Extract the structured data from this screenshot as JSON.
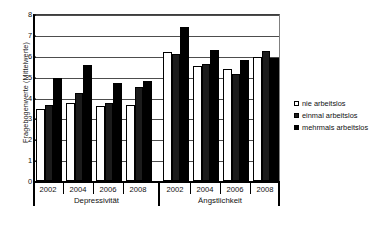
{
  "chart_data": {
    "type": "bar",
    "title": "",
    "xlabel": "",
    "ylabel": "Fragebogenwerte (Mittelwerte)",
    "ylim": [
      0,
      8
    ],
    "ytick_labels": [
      "0",
      "1",
      "2",
      "3",
      "4",
      "5",
      "6",
      "7",
      "8"
    ],
    "yticks": [
      0,
      1,
      2,
      3,
      4,
      5,
      6,
      7,
      8
    ],
    "grid": true,
    "legend_position": "right",
    "sections": [
      {
        "label": "Depressivität",
        "categories": [
          "2002",
          "2004",
          "2006",
          "2008"
        ]
      },
      {
        "label": "Ängstlichkeit",
        "categories": [
          "2002",
          "2004",
          "2006",
          "2008"
        ]
      }
    ],
    "categories": [
      "2002",
      "2004",
      "2006",
      "2008",
      "2002",
      "2004",
      "2006",
      "2008"
    ],
    "series": [
      {
        "name": "nie arbeitslos",
        "color": "#ffffff",
        "values": [
          3.45,
          3.75,
          3.6,
          3.65,
          6.2,
          5.5,
          5.35,
          5.95
        ]
      },
      {
        "name": "einmal arbeitslos",
        "color": "#1c1c1c",
        "values": [
          3.65,
          4.2,
          3.75,
          4.5,
          6.1,
          5.6,
          5.15,
          6.25
        ]
      },
      {
        "name": "mehrmals arbeitslos",
        "color": "#000000",
        "values": [
          4.95,
          5.55,
          4.7,
          4.8,
          7.4,
          6.3,
          5.8,
          5.9
        ]
      }
    ]
  },
  "legend": {
    "items": [
      {
        "label": "nie arbeitslos"
      },
      {
        "label": "einmal arbeitslos"
      },
      {
        "label": "mehrmals arbeitslos"
      }
    ]
  }
}
